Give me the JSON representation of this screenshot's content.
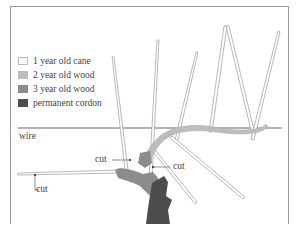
{
  "legend": {
    "items": [
      {
        "label": "1 year old cane",
        "color": "#ffffff",
        "border": "#b8b8b8"
      },
      {
        "label": "2 year old wood",
        "color": "#bdbdbd",
        "border": "#bdbdbd"
      },
      {
        "label": "3 year old wood",
        "color": "#8c8c8c",
        "border": "#8c8c8c"
      },
      {
        "label": "permanent cordon",
        "color": "#4d4d4d",
        "border": "#4d4d4d"
      }
    ]
  },
  "labels": {
    "wire": "wire",
    "cut_left": "cut",
    "cut_middle": "cut",
    "cut_right": "cut"
  }
}
